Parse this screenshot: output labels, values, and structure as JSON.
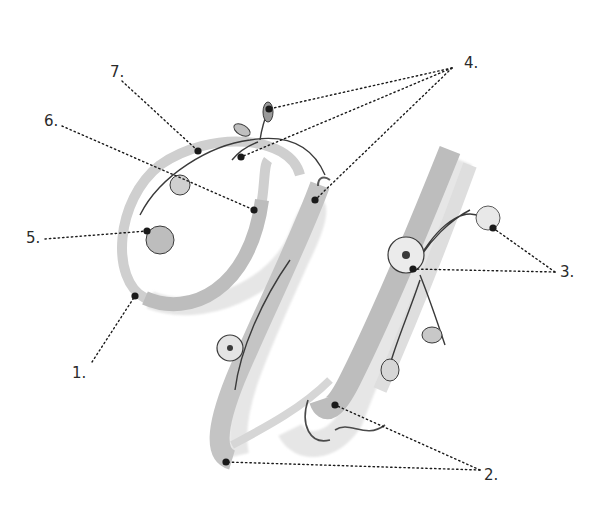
{
  "figure": {
    "colors": {
      "background": "#ffffff",
      "stroke_light": "#d9d9d9",
      "stroke_mid": "#bdbdbd",
      "stroke_dark": "#5a5a5a",
      "ink": "#1a1a1a",
      "label": "#2a2a2a"
    }
  },
  "callouts": [
    {
      "id": "1",
      "label": "1.",
      "label_pos": [
        72,
        378
      ],
      "leader_from": [
        92,
        362
      ],
      "targets": [
        [
          135,
          296
        ]
      ]
    },
    {
      "id": "2",
      "label": "2.",
      "label_pos": [
        484,
        480
      ],
      "leader_from": [
        480,
        470
      ],
      "targets": [
        [
          335,
          405
        ],
        [
          226,
          462
        ]
      ]
    },
    {
      "id": "3",
      "label": "3.",
      "label_pos": [
        560,
        277
      ],
      "leader_from": [
        555,
        272
      ],
      "targets": [
        [
          493,
          228
        ],
        [
          413,
          269
        ]
      ]
    },
    {
      "id": "4",
      "label": "4.",
      "label_pos": [
        464,
        68
      ],
      "leader_from": [
        452,
        68
      ],
      "targets": [
        [
          269,
          109
        ],
        [
          241,
          157
        ],
        [
          315,
          200
        ]
      ]
    },
    {
      "id": "5",
      "label": "5.",
      "label_pos": [
        26,
        243
      ],
      "leader_from": [
        45,
        239
      ],
      "targets": [
        [
          147,
          231
        ]
      ]
    },
    {
      "id": "6",
      "label": "6.",
      "label_pos": [
        44,
        126
      ],
      "leader_from": [
        62,
        126
      ],
      "targets": [
        [
          254,
          210
        ]
      ]
    },
    {
      "id": "7",
      "label": "7.",
      "label_pos": [
        110,
        77
      ],
      "leader_from": [
        122,
        81
      ],
      "targets": [
        [
          198,
          151
        ]
      ]
    }
  ]
}
